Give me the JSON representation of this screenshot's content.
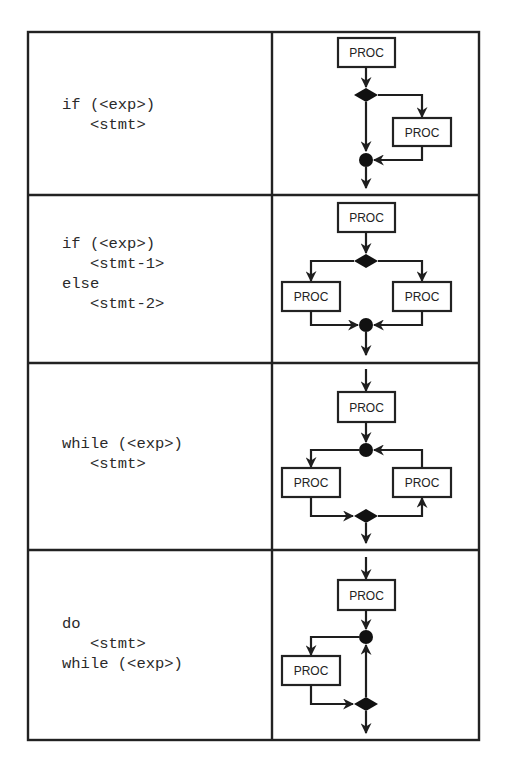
{
  "table": {
    "rows": [
      {
        "construct": "if",
        "code_lines": [
          "if (<exp>)",
          "   <stmt>"
        ],
        "flowchart": {
          "nodes": [
            "PROC",
            "decision",
            "PROC",
            "merge"
          ],
          "proc_labels": [
            "PROC",
            "PROC"
          ]
        }
      },
      {
        "construct": "if-else",
        "code_lines": [
          "if (<exp>)",
          "   <stmt-1>",
          "else",
          "   <stmt-2>"
        ],
        "flowchart": {
          "nodes": [
            "PROC",
            "decision",
            "PROC",
            "PROC",
            "merge"
          ],
          "proc_labels": [
            "PROC",
            "PROC",
            "PROC"
          ]
        }
      },
      {
        "construct": "while",
        "code_lines": [
          "while (<exp>)",
          "   <stmt>"
        ],
        "flowchart": {
          "nodes": [
            "PROC",
            "merge",
            "PROC",
            "PROC",
            "decision"
          ],
          "proc_labels": [
            "PROC",
            "PROC",
            "PROC"
          ]
        }
      },
      {
        "construct": "do-while",
        "code_lines": [
          "do",
          "   <stmt>",
          "while (<exp>)"
        ],
        "flowchart": {
          "nodes": [
            "PROC",
            "merge",
            "PROC",
            "decision"
          ],
          "proc_labels": [
            "PROC",
            "PROC"
          ]
        }
      }
    ]
  },
  "legend": {
    "decision_symbol": "filled-diamond",
    "merge_symbol": "filled-circle",
    "process_symbol": "box"
  },
  "colors": {
    "line": "#1e1e1e",
    "fill_node": "#111111",
    "background": "#ffffff"
  }
}
